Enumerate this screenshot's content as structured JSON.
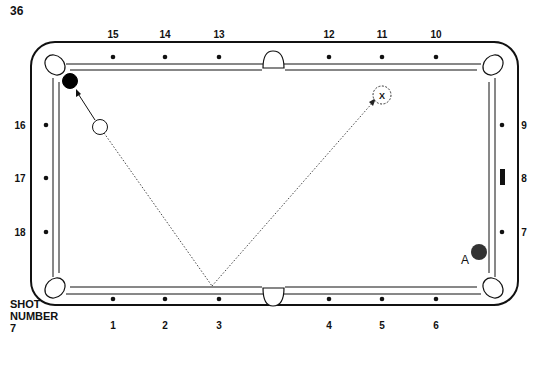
{
  "page": {
    "number": "36"
  },
  "caption": {
    "line1": "SHOT",
    "line2": "NUMBER",
    "line3": "7"
  },
  "diamonds": {
    "top": [
      {
        "label": "15",
        "x": 113
      },
      {
        "label": "14",
        "x": 165
      },
      {
        "label": "13",
        "x": 219
      },
      {
        "label": "12",
        "x": 329
      },
      {
        "label": "11",
        "x": 382
      },
      {
        "label": "10",
        "x": 436
      }
    ],
    "bottom": [
      {
        "label": "1",
        "x": 113
      },
      {
        "label": "2",
        "x": 165
      },
      {
        "label": "3",
        "x": 219
      },
      {
        "label": "4",
        "x": 329
      },
      {
        "label": "5",
        "x": 382
      },
      {
        "label": "6",
        "x": 436
      }
    ],
    "left": [
      {
        "label": "16",
        "y": 125
      },
      {
        "label": "17",
        "y": 178
      },
      {
        "label": "18",
        "y": 232
      }
    ],
    "right": [
      {
        "label": "9",
        "y": 125
      },
      {
        "label": "8",
        "y": 178
      },
      {
        "label": "7",
        "y": 232
      }
    ]
  },
  "balls": {
    "object_ball": {
      "color": "#000000",
      "x": 70,
      "y": 81
    },
    "cue_ball": {
      "color": "#ffffff",
      "x": 100,
      "y": 127
    },
    "ball_a": {
      "label": "A",
      "color": "#333333",
      "x": 479,
      "y": 252
    },
    "target": {
      "label": "X",
      "x": 382,
      "y": 95
    }
  },
  "shot_path": {
    "bank_point": {
      "x": 212,
      "y": 286
    }
  }
}
